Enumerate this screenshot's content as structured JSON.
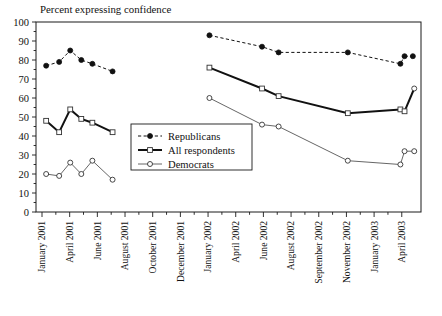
{
  "chart_data": {
    "type": "line",
    "title": "Percent expressing confidence",
    "xlabel": "",
    "ylabel": "",
    "ylim": [
      0,
      100
    ],
    "ytick_step": 10,
    "yticks": [
      0,
      10,
      20,
      30,
      40,
      50,
      60,
      70,
      80,
      90,
      100
    ],
    "grid": false,
    "legend_position": "center-left-inside",
    "categories": [
      "January 2001",
      "April 2001",
      "June 2001",
      "August 2001",
      "October 2001",
      "December 2001",
      "January 2002",
      "April 2002",
      "June 2002",
      "August 2002",
      "September 2002",
      "November 2002",
      "January 2003",
      "April 2003"
    ],
    "series": [
      {
        "name": "Republicans",
        "style": "dashed",
        "marker": "filled-circle",
        "color": "#111111",
        "points": [
          {
            "x": 0.15,
            "y": 77
          },
          {
            "x": 0.62,
            "y": 79
          },
          {
            "x": 1.02,
            "y": 85
          },
          {
            "x": 1.42,
            "y": 80
          },
          {
            "x": 1.82,
            "y": 78
          },
          {
            "x": 2.55,
            "y": 74
          },
          {
            "x": 6.05,
            "y": 93
          },
          {
            "x": 7.95,
            "y": 87
          },
          {
            "x": 8.55,
            "y": 84
          },
          {
            "x": 11.05,
            "y": 84
          },
          {
            "x": 12.95,
            "y": 78
          },
          {
            "x": 13.1,
            "y": 82
          }
        ]
      },
      {
        "name": "All respondents",
        "style": "solid-thick",
        "marker": "open-square",
        "color": "#111111",
        "points": [
          {
            "x": 0.15,
            "y": 48
          },
          {
            "x": 0.62,
            "y": 42
          },
          {
            "x": 1.02,
            "y": 54
          },
          {
            "x": 1.42,
            "y": 49
          },
          {
            "x": 1.82,
            "y": 47
          },
          {
            "x": 2.55,
            "y": 42
          },
          {
            "x": 6.05,
            "y": 76
          },
          {
            "x": 7.95,
            "y": 65
          },
          {
            "x": 8.55,
            "y": 61
          },
          {
            "x": 11.05,
            "y": 52
          },
          {
            "x": 12.95,
            "y": 54
          },
          {
            "x": 13.1,
            "y": 53
          }
        ]
      },
      {
        "name": "Democrats",
        "style": "solid-thin",
        "marker": "open-circle",
        "color": "#555555",
        "points": [
          {
            "x": 0.15,
            "y": 20
          },
          {
            "x": 0.62,
            "y": 19
          },
          {
            "x": 1.02,
            "y": 26
          },
          {
            "x": 1.42,
            "y": 20
          },
          {
            "x": 1.82,
            "y": 27
          },
          {
            "x": 2.55,
            "y": 17
          },
          {
            "x": 6.05,
            "y": 60
          },
          {
            "x": 7.95,
            "y": 46
          },
          {
            "x": 8.55,
            "y": 45
          },
          {
            "x": 11.05,
            "y": 27
          },
          {
            "x": 12.95,
            "y": 25
          },
          {
            "x": 13.1,
            "y": 32
          }
        ]
      }
    ],
    "extra_segments": [
      {
        "series": "Republicans",
        "from": {
          "x": 13.1,
          "y": 82
        },
        "to": {
          "x": 13.4,
          "y": 82
        }
      },
      {
        "series": "All respondents",
        "from": {
          "x": 13.1,
          "y": 53
        },
        "to": {
          "x": 13.45,
          "y": 65
        }
      },
      {
        "series": "Democrats",
        "from": {
          "x": 13.1,
          "y": 32
        },
        "to": {
          "x": 13.45,
          "y": 32
        }
      }
    ],
    "endpoints": [
      {
        "series": "All respondents",
        "x": 13.45,
        "y": 65,
        "marker": "open-circle"
      }
    ]
  },
  "legend": {
    "entries": [
      {
        "label": "Republicans"
      },
      {
        "label": "All respondents"
      },
      {
        "label": "Democrats"
      }
    ]
  },
  "axis": {
    "y_labels": [
      "100",
      "90",
      "80",
      "70",
      "60",
      "50",
      "40",
      "30",
      "20",
      "10",
      "0"
    ],
    "x_labels": [
      "January 2001",
      "April 2001",
      "June 2001",
      "August 2001",
      "October 2001",
      "December 2001",
      "January 2002",
      "April 2002",
      "June 2002",
      "August 2002",
      "September 2002",
      "November 2002",
      "January 2003",
      "April 2003"
    ]
  }
}
